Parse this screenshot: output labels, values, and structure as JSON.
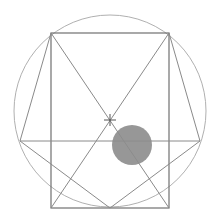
{
  "diagram": {
    "title": "",
    "colors": {
      "background": "#ffffff",
      "circle_stroke": "#b0b0b0",
      "rect_stroke": "#707070",
      "line_stroke": "#8a8a8a",
      "dot_fill": "#8c8c8c",
      "center_mark": "#555555"
    },
    "outer_circle": {
      "cx": 110,
      "cy": 111,
      "r": 96
    },
    "rectangle": {
      "x": 51,
      "y": 33,
      "width": 118,
      "height": 175
    },
    "center_mark": {
      "x": 110,
      "y": 120,
      "size": 6
    },
    "horizontal_line": {
      "x1": 20,
      "y1": 141,
      "x2": 200,
      "y2": 141
    },
    "diagonals": [
      {
        "x1": 51,
        "y1": 33,
        "x2": 169,
        "y2": 208
      },
      {
        "x1": 169,
        "y1": 33,
        "x2": 51,
        "y2": 208
      }
    ],
    "polygon_edges": [
      {
        "x1": 51,
        "y1": 33,
        "x2": 20,
        "y2": 141
      },
      {
        "x1": 169,
        "y1": 33,
        "x2": 200,
        "y2": 141
      },
      {
        "x1": 20,
        "y1": 141,
        "x2": 110,
        "y2": 208
      },
      {
        "x1": 200,
        "y1": 141,
        "x2": 110,
        "y2": 208
      }
    ],
    "filled_dot": {
      "cx": 132,
      "cy": 145,
      "r": 20
    }
  }
}
